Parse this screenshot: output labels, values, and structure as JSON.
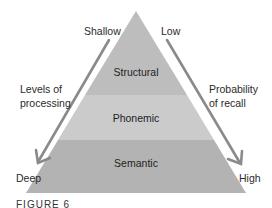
{
  "diagram": {
    "type": "pyramid",
    "layers": [
      {
        "label": "Structural",
        "fill": "#bdbdbd"
      },
      {
        "label": "Phonemic",
        "fill": "#cbcbcb"
      },
      {
        "label": "Semantic",
        "fill": "#b2b2b2"
      }
    ],
    "left_axis": {
      "top_label": "Shallow",
      "bottom_label": "Deep",
      "title_line1": "Levels of",
      "title_line2": "processing"
    },
    "right_axis": {
      "top_label": "Low",
      "bottom_label": "High",
      "title_line1": "Probability",
      "title_line2": "of recall"
    },
    "arrow_color": "#8a8a8a",
    "caption": "FIGURE 6"
  }
}
